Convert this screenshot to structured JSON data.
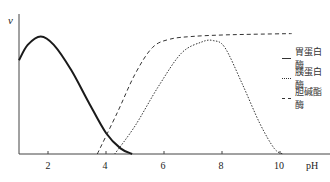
{
  "chart_data": {
    "type": "line",
    "title": "",
    "xlabel": "pH",
    "ylabel": "v",
    "xlim": [
      1,
      11.5
    ],
    "ylim": [
      0,
      1
    ],
    "grid": false,
    "legend_position": "right",
    "xticks": [
      2,
      4,
      6,
      8,
      10
    ],
    "series": [
      {
        "name": "胃蛋白酶",
        "style": "solid",
        "points": [
          [
            1.0,
            0.67
          ],
          [
            1.3,
            0.78
          ],
          [
            1.75,
            0.84
          ],
          [
            2.2,
            0.78
          ],
          [
            2.8,
            0.6
          ],
          [
            3.4,
            0.37
          ],
          [
            4.0,
            0.15
          ],
          [
            4.5,
            0.04
          ],
          [
            4.9,
            0.0
          ]
        ]
      },
      {
        "name": "胰蛋白酶",
        "style": "dotted",
        "points": [
          [
            4.3,
            0.0
          ],
          [
            5.0,
            0.2
          ],
          [
            5.8,
            0.48
          ],
          [
            6.6,
            0.72
          ],
          [
            7.3,
            0.8
          ],
          [
            7.7,
            0.81
          ],
          [
            8.1,
            0.76
          ],
          [
            8.7,
            0.5
          ],
          [
            9.3,
            0.22
          ],
          [
            9.8,
            0.04
          ],
          [
            10.1,
            0.0
          ]
        ]
      },
      {
        "name": "胆碱酯酶",
        "style": "dashed",
        "points": [
          [
            3.7,
            0.0
          ],
          [
            4.4,
            0.3
          ],
          [
            5.0,
            0.57
          ],
          [
            5.6,
            0.76
          ],
          [
            6.2,
            0.82
          ],
          [
            7.0,
            0.84
          ],
          [
            8.0,
            0.85
          ],
          [
            9.0,
            0.855
          ],
          [
            10.4,
            0.86
          ]
        ]
      }
    ]
  },
  "axes": {
    "ylabel": "v",
    "xlabel": "pH",
    "xticks": [
      "2",
      "4",
      "6",
      "8",
      "10"
    ]
  },
  "legend": [
    {
      "label": "胃蛋白酶",
      "style": "solid"
    },
    {
      "label": "胰蛋白酶",
      "style": "dotted"
    },
    {
      "label": "胆碱酯酶",
      "style": "dashed"
    }
  ],
  "colors": {
    "line": "#1a1a1a",
    "axis": "#444444"
  }
}
